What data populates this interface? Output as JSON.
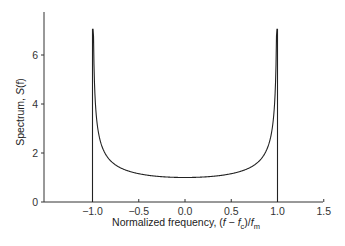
{
  "chart_data": {
    "type": "line",
    "title": "",
    "xlabel": {
      "main": "Normalized frequency, (",
      "f": "f",
      "minus": " − ",
      "fc": "f",
      "fc_sub": "c",
      "close": ")/",
      "fm": "f",
      "fm_sub": "m"
    },
    "ylabel": {
      "main": "Spectrum, ",
      "S": "S",
      "arg": "(f)"
    },
    "xlim": [
      -1.5,
      1.5
    ],
    "ylim": [
      0,
      7.6
    ],
    "xticks": [
      -1.0,
      -0.5,
      0.0,
      0.5,
      1.0,
      1.5
    ],
    "xtick_labels": [
      "−1.0",
      "−0.5",
      "0.0",
      "0.5",
      "1.0",
      "1.5"
    ],
    "yticks": [
      0,
      2,
      4,
      6
    ],
    "ytick_labels": [
      "0",
      "2",
      "4",
      "6"
    ],
    "grid": false,
    "legend": "none",
    "series": [
      {
        "name": "S(f)",
        "formula": "1/sqrt(1 - x^2) for |x| < 1, vertical edges at x = ±1, clipped at peak",
        "peak": 7.05,
        "x": [
          -1.0,
          -0.995,
          -0.99,
          -0.98,
          -0.95,
          -0.9,
          -0.8,
          -0.7,
          -0.6,
          -0.5,
          -0.4,
          -0.3,
          -0.2,
          -0.1,
          0.0,
          0.1,
          0.2,
          0.3,
          0.4,
          0.5,
          0.6,
          0.7,
          0.8,
          0.9,
          0.95,
          0.98,
          0.99,
          0.995,
          1.0
        ],
        "y": [
          0,
          7.05,
          7.05,
          5.03,
          3.2,
          2.29,
          1.67,
          1.4,
          1.25,
          1.15,
          1.09,
          1.05,
          1.02,
          1.01,
          1.0,
          1.01,
          1.02,
          1.05,
          1.09,
          1.15,
          1.25,
          1.4,
          1.67,
          2.29,
          3.2,
          5.03,
          7.05,
          7.05,
          0
        ]
      }
    ]
  }
}
